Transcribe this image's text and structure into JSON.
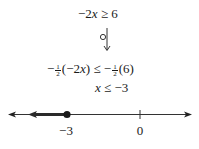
{
  "steps": {
    "original": {
      "coef": "−2",
      "var": "x",
      "op": " ≥ ",
      "rhs": "6"
    },
    "multiply": {
      "neg": "−",
      "frac_num": "1",
      "frac_den": "2",
      "lhs_paren_open": "(−2",
      "var": "x",
      "lhs_paren_close": ")",
      "op": " ≤ ",
      "neg2": "−",
      "rhs_paren": "(6)"
    },
    "result": {
      "var": "x",
      "op": " ≤ ",
      "rhs": "−3"
    }
  },
  "number_line": {
    "tick_labels": [
      "−3",
      "0"
    ],
    "solution_endpoint": "−3",
    "endpoint_type": "closed",
    "shaded_direction": "left",
    "colors": {
      "line": "#333333",
      "shade": "#2a2a2a",
      "dot": "#1a1a1a"
    }
  }
}
